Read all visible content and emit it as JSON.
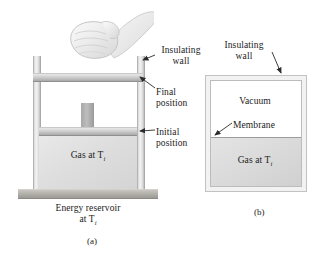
{
  "figure": {
    "panels": [
      {
        "id": "a",
        "caption": "(a)",
        "labels": {
          "insulating_wall": "Insulating\nwall",
          "insulating_wall_line1": "Insulating",
          "insulating_wall_line2": "wall",
          "final_position_line1": "Final",
          "final_position_line2": "position",
          "initial_position_line1": "Initial",
          "initial_position_line2": "position",
          "gas_label": "Gas at T",
          "gas_subscript": "i",
          "reservoir_line1": "Energy reservoir",
          "reservoir_line2": "at T",
          "reservoir_subscript": "i"
        }
      },
      {
        "id": "b",
        "caption": "(b)",
        "labels": {
          "insulating_wall_line1": "Insulating",
          "insulating_wall_line2": "wall",
          "vacuum": "Vacuum",
          "membrane": "Membrane",
          "gas_label": "Gas at T",
          "gas_subscript": "i"
        }
      }
    ],
    "colors": {
      "background": "#ffffff",
      "text": "#1b1b1b",
      "gas_fill": "#dedede",
      "wall_fill": "#e2e2e2",
      "reservoir_fill": "#b4b0aa",
      "piston_fill": "#c0c0c0",
      "arrow": "#2b2b2b",
      "vacuum_fill": "#ffffff",
      "membrane": "#9c9c9c"
    },
    "icons": {
      "hand": "hand-gripping-icon",
      "arrow": "pointer-arrow-icon"
    }
  }
}
